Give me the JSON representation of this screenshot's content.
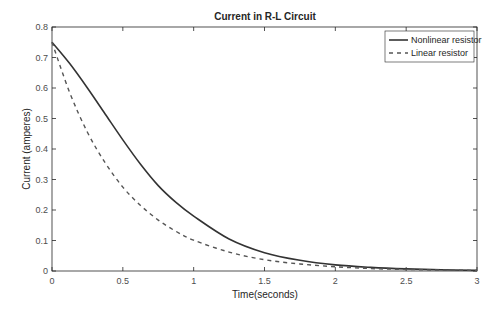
{
  "chart_data": {
    "type": "line",
    "title": "Current in R-L Circuit",
    "xlabel": "Time(seconds)",
    "ylabel": "Current (amperes)",
    "xlim": [
      0,
      3
    ],
    "ylim": [
      0,
      0.8
    ],
    "xticks": [
      "0",
      "0.5",
      "1",
      "1.5",
      "2",
      "2.5",
      "3"
    ],
    "yticks": [
      "0",
      "0.1",
      "0.2",
      "0.3",
      "0.4",
      "0.5",
      "0.6",
      "0.7",
      "0.8"
    ],
    "grid": false,
    "legend_position": "upper right",
    "x": [
      0,
      0.125,
      0.25,
      0.375,
      0.5,
      0.625,
      0.75,
      0.875,
      1.0,
      1.25,
      1.5,
      1.75,
      2.0,
      2.25,
      2.5,
      2.75,
      3.0
    ],
    "series": [
      {
        "name": "Nonlinear resistor",
        "style": "solid",
        "color": "#333333",
        "values": [
          0.75,
          0.68,
          0.6,
          0.515,
          0.43,
          0.35,
          0.28,
          0.225,
          0.18,
          0.105,
          0.06,
          0.035,
          0.02,
          0.012,
          0.007,
          0.004,
          0.002
        ]
      },
      {
        "name": "Linear resistor",
        "style": "dashed",
        "color": "#555555",
        "values": [
          0.75,
          0.585,
          0.455,
          0.355,
          0.275,
          0.215,
          0.167,
          0.13,
          0.101,
          0.062,
          0.037,
          0.023,
          0.014,
          0.008,
          0.005,
          0.003,
          0.002
        ]
      }
    ]
  }
}
